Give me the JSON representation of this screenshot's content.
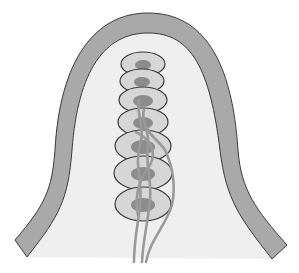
{
  "diagram": {
    "title": "",
    "colors": {
      "background": "#ffffff",
      "lumen": "#efefef",
      "outer_layer": "#a9a9a9",
      "outline": "#3a3a3a",
      "cell_body": "#d6d6d6",
      "nucleus": "#8c8c8c",
      "fiber": "#9a9a9a"
    },
    "cells": [
      {
        "cx": 143,
        "cy": 64,
        "rx": 22,
        "ry": 12,
        "nrx": 8,
        "nry": 5
      },
      {
        "cx": 142,
        "cy": 81,
        "rx": 22,
        "ry": 12,
        "nrx": 8,
        "nry": 5
      },
      {
        "cx": 143,
        "cy": 100,
        "rx": 24,
        "ry": 13,
        "nrx": 10,
        "nry": 6
      },
      {
        "cx": 143,
        "cy": 122,
        "rx": 25,
        "ry": 14,
        "nrx": 10,
        "nry": 6
      },
      {
        "cx": 143,
        "cy": 146,
        "rx": 28,
        "ry": 16,
        "nrx": 12,
        "nry": 7
      },
      {
        "cx": 143,
        "cy": 173,
        "rx": 29,
        "ry": 17,
        "nrx": 12,
        "nry": 7
      },
      {
        "cx": 143,
        "cy": 204,
        "rx": 28,
        "ry": 17,
        "nrx": 12,
        "nry": 7
      }
    ],
    "labels": []
  }
}
